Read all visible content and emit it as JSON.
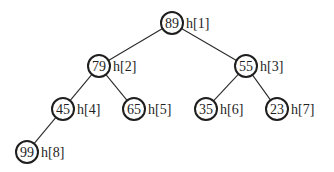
{
  "diagram": {
    "type": "binary-heap-tree",
    "colors": {
      "stroke": "#1e1e1e",
      "background": "#ffffff"
    },
    "nodes": [
      {
        "id": 1,
        "value": "89",
        "label": "h[1]",
        "cx": 172,
        "cy": 23
      },
      {
        "id": 2,
        "value": "79",
        "label": "h[2]",
        "cx": 99,
        "cy": 66
      },
      {
        "id": 3,
        "value": "55",
        "label": "h[3]",
        "cx": 246,
        "cy": 66
      },
      {
        "id": 4,
        "value": "45",
        "label": "h[4]",
        "cx": 63,
        "cy": 109
      },
      {
        "id": 5,
        "value": "65",
        "label": "h[5]",
        "cx": 134,
        "cy": 109
      },
      {
        "id": 6,
        "value": "35",
        "label": "h[6]",
        "cx": 206,
        "cy": 109
      },
      {
        "id": 7,
        "value": "23",
        "label": "h[7]",
        "cx": 277,
        "cy": 109
      },
      {
        "id": 8,
        "value": "99",
        "label": "h[8]",
        "cx": 27,
        "cy": 152
      }
    ],
    "edges": [
      {
        "from": 1,
        "to": 2
      },
      {
        "from": 1,
        "to": 3
      },
      {
        "from": 2,
        "to": 4
      },
      {
        "from": 2,
        "to": 5
      },
      {
        "from": 3,
        "to": 6
      },
      {
        "from": 3,
        "to": 7
      },
      {
        "from": 4,
        "to": 8
      }
    ]
  }
}
